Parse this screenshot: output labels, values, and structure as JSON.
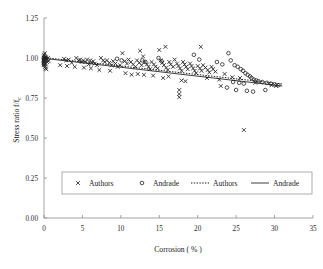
{
  "chart_data": {
    "type": "scatter",
    "title": "",
    "xlabel": "Corrosion ( % )",
    "ylabel": "Stress ratio f/fc",
    "ylabel_main": "Stress ratio f/f",
    "ylabel_sub": "c",
    "xlim": [
      0,
      35
    ],
    "ylim": [
      0,
      1.25
    ],
    "xticks": [
      0,
      5,
      10,
      15,
      20,
      25,
      30,
      35
    ],
    "xtick_labels": [
      "0",
      "5",
      "10",
      "15",
      "20",
      "25",
      "30",
      "35"
    ],
    "yticks": [
      0.0,
      0.25,
      0.5,
      0.75,
      1.0,
      1.25
    ],
    "ytick_labels": [
      "0.00",
      "0.25",
      "0.50",
      "0.75",
      "1.00",
      "1.25"
    ],
    "grid": false,
    "legend_position": "bottom-inside",
    "legend": [
      {
        "label": "Authors",
        "marker": "x-marker-icon",
        "kind": "marker"
      },
      {
        "label": "Andrade",
        "marker": "circle-marker-icon",
        "kind": "marker"
      },
      {
        "label": "Authors",
        "marker": "dotted-line-icon",
        "kind": "line"
      },
      {
        "label": "Andrade",
        "marker": "solid-line-icon",
        "kind": "line"
      }
    ],
    "series": [
      {
        "name": "Authors",
        "marker": "x",
        "points": [
          [
            0.0,
            1.02
          ],
          [
            0.0,
            1.01
          ],
          [
            0.0,
            1.0
          ],
          [
            0.0,
            1.0
          ],
          [
            0.0,
            0.99
          ],
          [
            0.0,
            0.985
          ],
          [
            0.0,
            0.975
          ],
          [
            0.0,
            0.97
          ],
          [
            0.0,
            0.96
          ],
          [
            0.0,
            0.955
          ],
          [
            0.1,
            1.03
          ],
          [
            0.1,
            0.995
          ],
          [
            0.15,
            0.945
          ],
          [
            0.2,
            1.005
          ],
          [
            0.25,
            0.965
          ],
          [
            0.3,
            1.0
          ],
          [
            0.35,
            0.99
          ],
          [
            0.4,
            0.975
          ],
          [
            0.5,
            1.0
          ],
          [
            0.6,
            0.98
          ],
          [
            0.2,
            0.935
          ],
          [
            0.3,
            0.93
          ],
          [
            2.6,
            0.995
          ],
          [
            2.9,
            0.985
          ],
          [
            3.2,
            0.99
          ],
          [
            3.6,
            0.97
          ],
          [
            4.2,
            1.0
          ],
          [
            4.5,
            0.985
          ],
          [
            4.7,
            0.99
          ],
          [
            4.9,
            0.975
          ],
          [
            5.1,
            0.985
          ],
          [
            5.4,
            0.975
          ],
          [
            5.6,
            0.99
          ],
          [
            5.8,
            0.96
          ],
          [
            6.0,
            0.985
          ],
          [
            6.2,
            0.97
          ],
          [
            6.4,
            0.98
          ],
          [
            6.6,
            0.965
          ],
          [
            6.9,
            0.955
          ],
          [
            7.4,
            1.0
          ],
          [
            7.7,
            0.985
          ],
          [
            7.9,
            0.975
          ],
          [
            8.2,
            0.985
          ],
          [
            8.5,
            0.97
          ],
          [
            8.8,
            0.955
          ],
          [
            9.0,
            0.98
          ],
          [
            9.3,
            0.965
          ],
          [
            9.6,
            0.945
          ],
          [
            9.9,
            0.955
          ],
          [
            10.2,
            1.03
          ],
          [
            10.5,
            0.98
          ],
          [
            10.8,
            0.965
          ],
          [
            11.0,
            0.99
          ],
          [
            11.3,
            0.975
          ],
          [
            11.6,
            0.96
          ],
          [
            11.9,
            0.945
          ],
          [
            12.1,
            0.985
          ],
          [
            12.4,
            0.97
          ],
          [
            12.7,
            0.955
          ],
          [
            12.9,
            1.01
          ],
          [
            13.1,
            0.975
          ],
          [
            13.4,
            0.96
          ],
          [
            13.6,
            0.945
          ],
          [
            13.8,
            0.93
          ],
          [
            14.0,
            0.975
          ],
          [
            14.3,
            0.96
          ],
          [
            14.5,
            0.945
          ],
          [
            14.8,
            0.935
          ],
          [
            15.0,
            1.05
          ],
          [
            15.2,
            0.985
          ],
          [
            15.4,
            0.97
          ],
          [
            15.6,
            0.955
          ],
          [
            15.9,
            0.94
          ],
          [
            16.1,
            0.925
          ],
          [
            16.3,
            0.975
          ],
          [
            16.5,
            0.96
          ],
          [
            16.8,
            0.945
          ],
          [
            17.0,
            0.99
          ],
          [
            17.3,
            0.965
          ],
          [
            17.5,
            0.95
          ],
          [
            17.7,
            0.935
          ],
          [
            17.9,
            0.92
          ],
          [
            18.1,
            0.975
          ],
          [
            18.3,
            0.96
          ],
          [
            18.5,
            0.945
          ],
          [
            18.7,
            0.93
          ],
          [
            19.0,
            0.965
          ],
          [
            19.2,
            0.95
          ],
          [
            19.4,
            0.935
          ],
          [
            19.6,
            0.92
          ],
          [
            19.8,
            0.905
          ],
          [
            20.0,
            0.95
          ],
          [
            20.3,
            0.935
          ],
          [
            20.5,
            0.92
          ],
          [
            20.7,
            0.955
          ],
          [
            21.0,
            0.94
          ],
          [
            21.3,
            0.925
          ],
          [
            21.5,
            0.91
          ],
          [
            21.8,
            0.945
          ],
          [
            22.0,
            0.93
          ],
          [
            22.3,
            0.915
          ],
          [
            14.2,
            0.89
          ],
          [
            15.5,
            0.875
          ],
          [
            16.2,
            0.885
          ],
          [
            12.2,
            0.9
          ],
          [
            13.0,
            0.895
          ],
          [
            10.6,
            0.905
          ],
          [
            11.4,
            0.895
          ],
          [
            8.6,
            0.92
          ],
          [
            7.2,
            0.925
          ],
          [
            6.1,
            0.935
          ],
          [
            5.2,
            0.94
          ],
          [
            4.0,
            0.945
          ],
          [
            3.0,
            0.95
          ],
          [
            2.1,
            0.955
          ],
          [
            17.6,
            0.8
          ],
          [
            17.6,
            0.775
          ],
          [
            17.6,
            0.755
          ],
          [
            17.9,
            0.86
          ],
          [
            18.4,
            0.855
          ],
          [
            21.2,
            0.875
          ],
          [
            22.8,
            0.865
          ],
          [
            15.8,
            1.07
          ],
          [
            20.4,
            1.07
          ],
          [
            12.5,
            1.045
          ],
          [
            23.5,
            0.9
          ],
          [
            24.5,
            0.88
          ],
          [
            25.5,
            0.875
          ],
          [
            26.0,
            0.55
          ],
          [
            27.5,
            0.845
          ],
          [
            23.0,
            0.825
          ],
          [
            29.6,
            0.83
          ],
          [
            30.2,
            0.825
          ]
        ]
      },
      {
        "name": "Andrade",
        "marker": "o",
        "points": [
          [
            0.0,
            1.0
          ],
          [
            0.0,
            0.99
          ],
          [
            0.0,
            0.98
          ],
          [
            0.0,
            0.97
          ],
          [
            0.0,
            0.96
          ],
          [
            0.1,
            1.01
          ],
          [
            0.2,
            0.995
          ],
          [
            9.5,
            0.995
          ],
          [
            10.1,
            0.985
          ],
          [
            12.8,
            0.985
          ],
          [
            13.2,
            0.975
          ],
          [
            14.9,
            1.0
          ],
          [
            15.3,
            0.98
          ],
          [
            19.5,
            1.02
          ],
          [
            20.2,
            0.99
          ],
          [
            22.5,
            0.975
          ],
          [
            23.2,
            0.96
          ],
          [
            24.0,
            1.03
          ],
          [
            24.3,
            0.985
          ],
          [
            24.8,
            0.955
          ],
          [
            25.2,
            0.945
          ],
          [
            25.6,
            0.93
          ],
          [
            25.9,
            0.92
          ],
          [
            26.2,
            0.905
          ],
          [
            26.5,
            0.895
          ],
          [
            26.8,
            0.885
          ],
          [
            27.0,
            0.875
          ],
          [
            27.3,
            0.865
          ],
          [
            27.6,
            0.86
          ],
          [
            24.6,
            0.85
          ],
          [
            25.4,
            0.845
          ],
          [
            26.0,
            0.84
          ],
          [
            27.9,
            0.855
          ],
          [
            28.4,
            0.85
          ],
          [
            29.0,
            0.845
          ],
          [
            29.5,
            0.84
          ],
          [
            30.0,
            0.835
          ],
          [
            30.5,
            0.83
          ],
          [
            25.0,
            0.8
          ],
          [
            26.4,
            0.795
          ],
          [
            27.2,
            0.79
          ],
          [
            28.8,
            0.8
          ],
          [
            23.8,
            0.815
          ]
        ]
      }
    ],
    "trendlines": [
      {
        "name": "Authors",
        "style": "dotted",
        "x_start": 0.0,
        "y_start": 1.003,
        "x_end": 31.0,
        "y_end": 0.838
      },
      {
        "name": "Andrade",
        "style": "solid",
        "x_start": 0.0,
        "y_start": 0.998,
        "x_end": 31.0,
        "y_end": 0.825
      }
    ]
  }
}
